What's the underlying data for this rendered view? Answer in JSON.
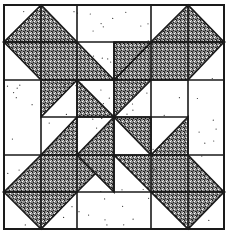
{
  "colors": {
    "background": "#ffffff",
    "line": "#1a1a1a",
    "shade": "#555555",
    "dot": "#333333"
  },
  "grid": {
    "x_lines": [
      4,
      41,
      77,
      114,
      151,
      188,
      224
    ],
    "y_lines": [
      5,
      42,
      80,
      117,
      155,
      192,
      229
    ]
  },
  "shaded_polygons": [
    {
      "name": "top-left-triangle",
      "points": [
        [
          1,
          0
        ],
        [
          0,
          1
        ],
        [
          2,
          1
        ]
      ]
    },
    {
      "name": "top-left-band",
      "points": [
        [
          0,
          1
        ],
        [
          2,
          1
        ],
        [
          3,
          2
        ],
        [
          1,
          2
        ]
      ]
    },
    {
      "name": "left-upper-small-triangle",
      "points": [
        [
          1,
          2
        ],
        [
          2,
          2
        ],
        [
          1,
          3
        ]
      ]
    },
    {
      "name": "top-right-triangle",
      "points": [
        [
          5,
          0
        ],
        [
          4,
          1
        ],
        [
          6,
          1
        ]
      ]
    },
    {
      "name": "top-right-band",
      "points": [
        [
          4,
          1
        ],
        [
          6,
          1
        ],
        [
          5,
          2
        ],
        [
          3,
          2
        ]
      ]
    },
    {
      "name": "top-mid-small-triangle",
      "points": [
        [
          3,
          1
        ],
        [
          4,
          1
        ],
        [
          3,
          2
        ]
      ]
    },
    {
      "name": "right-mid-small-triangle",
      "points": [
        [
          5,
          3
        ],
        [
          5,
          4
        ],
        [
          4,
          4
        ]
      ]
    },
    {
      "name": "right-band-lower",
      "points": [
        [
          3,
          4
        ],
        [
          5,
          4
        ],
        [
          6,
          5
        ],
        [
          4,
          5
        ]
      ]
    },
    {
      "name": "bottom-right-triangle",
      "points": [
        [
          4,
          5
        ],
        [
          6,
          5
        ],
        [
          5,
          6
        ]
      ]
    },
    {
      "name": "left-mid-small-triangle",
      "points": [
        [
          2,
          3
        ],
        [
          2,
          4
        ],
        [
          1,
          4
        ]
      ]
    },
    {
      "name": "bottom-left-band",
      "points": [
        [
          1,
          4
        ],
        [
          3,
          4
        ],
        [
          2,
          5
        ],
        [
          0,
          5
        ]
      ]
    },
    {
      "name": "bottom-left-triangle",
      "points": [
        [
          0,
          5
        ],
        [
          2,
          5
        ],
        [
          1,
          6
        ]
      ]
    },
    {
      "name": "bottom-mid-small-triangle",
      "points": [
        [
          2,
          4
        ],
        [
          3,
          4
        ],
        [
          3,
          5
        ]
      ]
    },
    {
      "name": "center-upper-right",
      "points": [
        [
          3,
          2
        ],
        [
          4,
          2
        ],
        [
          3,
          3
        ]
      ]
    },
    {
      "name": "center-lower-left",
      "points": [
        [
          3,
          3
        ],
        [
          3,
          4
        ],
        [
          2,
          4
        ]
      ]
    },
    {
      "name": "center-upper-left",
      "points": [
        [
          2,
          2
        ],
        [
          3,
          3
        ],
        [
          2,
          3
        ]
      ]
    },
    {
      "name": "center-lower-right",
      "points": [
        [
          4,
          3
        ],
        [
          4,
          4
        ],
        [
          3,
          3
        ]
      ]
    }
  ],
  "plain_rectangles": [
    {
      "name": "top-middle-plain",
      "x": [
        2,
        4
      ],
      "y": [
        0,
        1
      ]
    },
    {
      "name": "left-middle-plain",
      "x": [
        0,
        1
      ],
      "y": [
        2,
        4
      ]
    },
    {
      "name": "right-middle-plain",
      "x": [
        5,
        6
      ],
      "y": [
        2,
        4
      ]
    },
    {
      "name": "bottom-middle-plain",
      "x": [
        2,
        4
      ],
      "y": [
        5,
        6
      ]
    }
  ]
}
